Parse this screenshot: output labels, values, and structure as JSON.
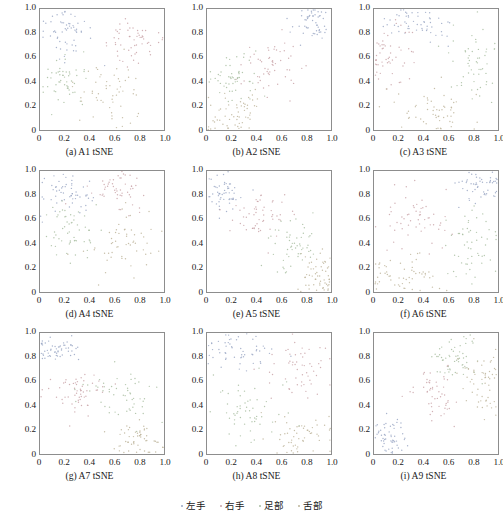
{
  "figure": {
    "rows": 3,
    "cols": 3,
    "background": "#ffffff",
    "axis_color": "#8d8d8d"
  },
  "legend": {
    "position": "bottom-center",
    "items": [
      {
        "label": "左手",
        "color": "#9aa7c4",
        "marker": "dot"
      },
      {
        "label": "右手",
        "color": "#c9a3a8",
        "marker": "dot"
      },
      {
        "label": "足部",
        "color": "#a8bda0",
        "marker": "dot"
      },
      {
        "label": "舌部",
        "color": "#bdb49a",
        "marker": "dot"
      }
    ]
  },
  "axis": {
    "xticks": [
      "0",
      "0.2",
      "0.4",
      "0.6",
      "0.8",
      "1.0"
    ],
    "xtick_values": [
      0,
      0.2,
      0.4,
      0.6,
      0.8,
      1.0
    ],
    "yticks": [
      "0",
      "0.2",
      "0.4",
      "0.6",
      "0.8",
      "1.0"
    ],
    "ytick_values": [
      0,
      0.2,
      0.4,
      0.6,
      0.8,
      1.0
    ],
    "xlim": [
      0,
      1
    ],
    "ylim": [
      0,
      1
    ],
    "grid": false
  },
  "chart_data": [
    {
      "id": "a",
      "type": "scatter",
      "title": "(a)  A1 tSNE",
      "xlabel": "",
      "ylabel": "",
      "xlim": [
        0,
        1
      ],
      "ylim": [
        0,
        1
      ],
      "grid": false,
      "n_points": 220,
      "clusters": [
        {
          "name": "左手",
          "color": "#9aa7c4",
          "cx": 0.22,
          "cy": 0.78,
          "sx": 0.1,
          "sy": 0.1,
          "n": 58
        },
        {
          "name": "右手",
          "color": "#c9a3a8",
          "cx": 0.76,
          "cy": 0.73,
          "sx": 0.11,
          "sy": 0.12,
          "n": 55
        },
        {
          "name": "足部",
          "color": "#a8bda0",
          "cx": 0.18,
          "cy": 0.38,
          "sx": 0.09,
          "sy": 0.11,
          "n": 52
        },
        {
          "name": "舌部",
          "color": "#bdb49a",
          "cx": 0.57,
          "cy": 0.28,
          "sx": 0.14,
          "sy": 0.13,
          "n": 55
        }
      ]
    },
    {
      "id": "b",
      "type": "scatter",
      "title": "(b)  A2 tSNE",
      "xlabel": "",
      "ylabel": "",
      "xlim": [
        0,
        1
      ],
      "ylim": [
        0,
        1
      ],
      "grid": false,
      "n_points": 220,
      "clusters": [
        {
          "name": "左手",
          "color": "#9aa7c4",
          "cx": 0.86,
          "cy": 0.88,
          "sx": 0.08,
          "sy": 0.07,
          "n": 52
        },
        {
          "name": "右手",
          "color": "#c9a3a8",
          "cx": 0.52,
          "cy": 0.52,
          "sx": 0.13,
          "sy": 0.11,
          "n": 56
        },
        {
          "name": "足部",
          "color": "#a8bda0",
          "cx": 0.22,
          "cy": 0.42,
          "sx": 0.1,
          "sy": 0.1,
          "n": 54
        },
        {
          "name": "舌部",
          "color": "#bdb49a",
          "cx": 0.26,
          "cy": 0.14,
          "sx": 0.14,
          "sy": 0.09,
          "n": 58
        }
      ]
    },
    {
      "id": "c",
      "type": "scatter",
      "title": "(c)  A3 tSNE",
      "xlabel": "",
      "ylabel": "",
      "xlim": [
        0,
        1
      ],
      "ylim": [
        0,
        1
      ],
      "grid": false,
      "n_points": 220,
      "clusters": [
        {
          "name": "左手",
          "color": "#9aa7c4",
          "cx": 0.36,
          "cy": 0.88,
          "sx": 0.14,
          "sy": 0.07,
          "n": 54
        },
        {
          "name": "右手",
          "color": "#c9a3a8",
          "cx": 0.12,
          "cy": 0.58,
          "sx": 0.09,
          "sy": 0.13,
          "n": 55
        },
        {
          "name": "足部",
          "color": "#a8bda0",
          "cx": 0.82,
          "cy": 0.52,
          "sx": 0.12,
          "sy": 0.18,
          "n": 54
        },
        {
          "name": "舌部",
          "color": "#bdb49a",
          "cx": 0.5,
          "cy": 0.16,
          "sx": 0.17,
          "sy": 0.1,
          "n": 57
        }
      ]
    },
    {
      "id": "d",
      "type": "scatter",
      "title": "(d)  A4 tSNE",
      "xlabel": "",
      "ylabel": "",
      "xlim": [
        0,
        1
      ],
      "ylim": [
        0,
        1
      ],
      "grid": false,
      "n_points": 220,
      "clusters": [
        {
          "name": "左手",
          "color": "#9aa7c4",
          "cx": 0.22,
          "cy": 0.82,
          "sx": 0.12,
          "sy": 0.08,
          "n": 58
        },
        {
          "name": "右手",
          "color": "#c9a3a8",
          "cx": 0.62,
          "cy": 0.82,
          "sx": 0.12,
          "sy": 0.09,
          "n": 52
        },
        {
          "name": "足部",
          "color": "#a8bda0",
          "cx": 0.24,
          "cy": 0.52,
          "sx": 0.11,
          "sy": 0.1,
          "n": 55
        },
        {
          "name": "舌部",
          "color": "#bdb49a",
          "cx": 0.72,
          "cy": 0.4,
          "sx": 0.14,
          "sy": 0.14,
          "n": 55
        }
      ]
    },
    {
      "id": "e",
      "type": "scatter",
      "title": "(e)  A5 tSNE",
      "xlabel": "",
      "ylabel": "",
      "xlim": [
        0,
        1
      ],
      "ylim": [
        0,
        1
      ],
      "grid": false,
      "n_points": 220,
      "clusters": [
        {
          "name": "左手",
          "color": "#9aa7c4",
          "cx": 0.14,
          "cy": 0.83,
          "sx": 0.08,
          "sy": 0.08,
          "n": 54
        },
        {
          "name": "右手",
          "color": "#c9a3a8",
          "cx": 0.42,
          "cy": 0.63,
          "sx": 0.12,
          "sy": 0.1,
          "n": 55
        },
        {
          "name": "足部",
          "color": "#a8bda0",
          "cx": 0.7,
          "cy": 0.37,
          "sx": 0.11,
          "sy": 0.11,
          "n": 55
        },
        {
          "name": "舌部",
          "color": "#bdb49a",
          "cx": 0.9,
          "cy": 0.13,
          "sx": 0.08,
          "sy": 0.1,
          "n": 56
        }
      ]
    },
    {
      "id": "f",
      "type": "scatter",
      "title": "(f)  A6 tSNE",
      "xlabel": "",
      "ylabel": "",
      "xlim": [
        0,
        1
      ],
      "ylim": [
        0,
        1
      ],
      "grid": false,
      "n_points": 220,
      "clusters": [
        {
          "name": "左手",
          "color": "#9aa7c4",
          "cx": 0.84,
          "cy": 0.88,
          "sx": 0.1,
          "sy": 0.07,
          "n": 52
        },
        {
          "name": "右手",
          "color": "#c9a3a8",
          "cx": 0.3,
          "cy": 0.6,
          "sx": 0.14,
          "sy": 0.13,
          "n": 56
        },
        {
          "name": "足部",
          "color": "#a8bda0",
          "cx": 0.8,
          "cy": 0.42,
          "sx": 0.12,
          "sy": 0.14,
          "n": 55
        },
        {
          "name": "舌部",
          "color": "#bdb49a",
          "cx": 0.24,
          "cy": 0.12,
          "sx": 0.16,
          "sy": 0.09,
          "n": 57
        }
      ]
    },
    {
      "id": "g",
      "type": "scatter",
      "title": "(g)  A7 tSNE",
      "xlabel": "",
      "ylabel": "",
      "xlim": [
        0,
        1
      ],
      "ylim": [
        0,
        1
      ],
      "grid": false,
      "n_points": 220,
      "clusters": [
        {
          "name": "左手",
          "color": "#9aa7c4",
          "cx": 0.14,
          "cy": 0.86,
          "sx": 0.1,
          "sy": 0.05,
          "n": 56
        },
        {
          "name": "右手",
          "color": "#c9a3a8",
          "cx": 0.3,
          "cy": 0.52,
          "sx": 0.13,
          "sy": 0.11,
          "n": 56
        },
        {
          "name": "足部",
          "color": "#a8bda0",
          "cx": 0.68,
          "cy": 0.5,
          "sx": 0.14,
          "sy": 0.12,
          "n": 54
        },
        {
          "name": "舌部",
          "color": "#bdb49a",
          "cx": 0.8,
          "cy": 0.12,
          "sx": 0.1,
          "sy": 0.07,
          "n": 54
        }
      ]
    },
    {
      "id": "h",
      "type": "scatter",
      "title": "(h)  A8 tSNE",
      "xlabel": "",
      "ylabel": "",
      "xlim": [
        0,
        1
      ],
      "ylim": [
        0,
        1
      ],
      "grid": false,
      "n_points": 220,
      "clusters": [
        {
          "name": "左手",
          "color": "#9aa7c4",
          "cx": 0.24,
          "cy": 0.84,
          "sx": 0.12,
          "sy": 0.08,
          "n": 55
        },
        {
          "name": "右手",
          "color": "#c9a3a8",
          "cx": 0.72,
          "cy": 0.72,
          "sx": 0.13,
          "sy": 0.14,
          "n": 55
        },
        {
          "name": "足部",
          "color": "#a8bda0",
          "cx": 0.34,
          "cy": 0.36,
          "sx": 0.14,
          "sy": 0.14,
          "n": 56
        },
        {
          "name": "舌部",
          "color": "#bdb49a",
          "cx": 0.76,
          "cy": 0.18,
          "sx": 0.14,
          "sy": 0.11,
          "n": 54
        }
      ]
    },
    {
      "id": "i",
      "type": "scatter",
      "title": "(i)  A9 tSNE",
      "xlabel": "",
      "ylabel": "",
      "xlim": [
        0,
        1
      ],
      "ylim": [
        0,
        1
      ],
      "grid": false,
      "n_points": 220,
      "clusters": [
        {
          "name": "左手",
          "color": "#9aa7c4",
          "cx": 0.14,
          "cy": 0.14,
          "sx": 0.07,
          "sy": 0.09,
          "n": 54
        },
        {
          "name": "右手",
          "color": "#c9a3a8",
          "cx": 0.5,
          "cy": 0.5,
          "sx": 0.09,
          "sy": 0.12,
          "n": 52
        },
        {
          "name": "足部",
          "color": "#a8bda0",
          "cx": 0.66,
          "cy": 0.8,
          "sx": 0.1,
          "sy": 0.11,
          "n": 56
        },
        {
          "name": "舌部",
          "color": "#bdb49a",
          "cx": 0.86,
          "cy": 0.62,
          "sx": 0.09,
          "sy": 0.13,
          "n": 58
        }
      ]
    }
  ]
}
